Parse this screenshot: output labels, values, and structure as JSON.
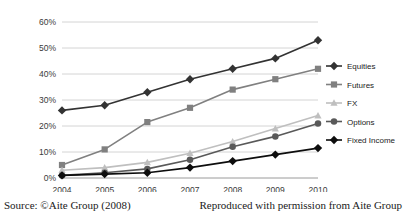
{
  "caption": {
    "source": "Source: ©Aite Group (2008)",
    "permission": "Reproduced with permission from Aite Group"
  },
  "chart_data": {
    "type": "line",
    "title": "",
    "xlabel": "",
    "ylabel": "",
    "categories": [
      "2004",
      "2005",
      "2006",
      "2007",
      "2008",
      "2009",
      "2010"
    ],
    "ytick_labels": [
      "0%",
      "10%",
      "20%",
      "30%",
      "40%",
      "50%",
      "60%"
    ],
    "ytick_values": [
      0,
      10,
      20,
      30,
      40,
      50,
      60
    ],
    "ylim": [
      0,
      60
    ],
    "grid": true,
    "legend_position": "right",
    "series": [
      {
        "name": "Equities",
        "color": "#333333",
        "marker": "diamond",
        "values": [
          26,
          28,
          33,
          38,
          42,
          46,
          53
        ]
      },
      {
        "name": "Futures",
        "color": "#808080",
        "marker": "square",
        "values": [
          5,
          11,
          21.5,
          27,
          34,
          38,
          42
        ]
      },
      {
        "name": "FX",
        "color": "#bfbfbf",
        "marker": "triangle",
        "values": [
          3,
          4,
          6,
          9.5,
          14,
          19,
          24
        ]
      },
      {
        "name": "Options",
        "color": "#595959",
        "marker": "circle",
        "values": [
          1,
          2,
          3.5,
          7,
          12,
          16,
          21
        ]
      },
      {
        "name": "Fixed Income",
        "color": "#0d0d0d",
        "marker": "diamond",
        "values": [
          1,
          1.5,
          2,
          4,
          6.5,
          9,
          11.5
        ]
      }
    ]
  }
}
